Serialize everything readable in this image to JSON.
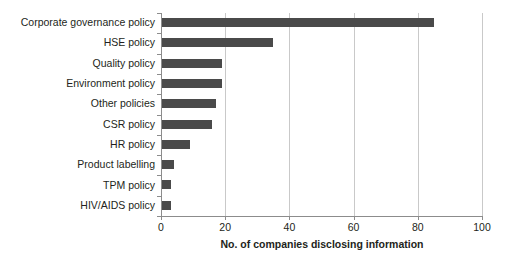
{
  "chart_data": {
    "type": "bar",
    "orientation": "horizontal",
    "title": "",
    "xlabel": "No. of companies disclosing information",
    "ylabel": "",
    "xlim": [
      0,
      100
    ],
    "xticks": [
      0,
      20,
      40,
      60,
      80,
      100
    ],
    "grid": "vertical",
    "legend": "none",
    "bar_color": "#4a4a4a",
    "categories": [
      "Corporate governance policy",
      "HSE policy",
      "Quality policy",
      "Environment policy",
      "Other policies",
      "CSR policy",
      "HR policy",
      "Product labelling",
      "TPM policy",
      "HIV/AIDS policy"
    ],
    "values": [
      85,
      35,
      19,
      19,
      17,
      16,
      9,
      4,
      3,
      3
    ]
  }
}
